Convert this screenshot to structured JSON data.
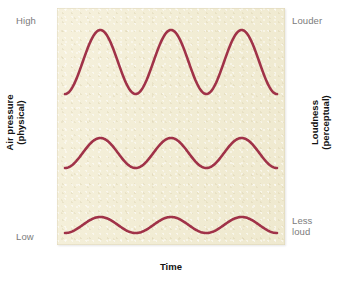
{
  "figure": {
    "axes": {
      "left_title": "Air pressure\n(physical)",
      "right_title": "Loudness\n(perceptual)",
      "bottom_title": "Time",
      "left_top_label": "High",
      "left_bottom_label": "Low",
      "right_top_label": "Louder",
      "right_bottom_label": "Less\nloud"
    },
    "colors": {
      "wave": "#a03248",
      "panel_background": "#f3eed7",
      "scale_label": "#7b7b7b",
      "axis_title": "#131313"
    }
  },
  "chart_data": {
    "type": "line",
    "title": "",
    "xlabel": "Time",
    "ylabel": "Air pressure (physical)",
    "ylabel_right": "Loudness (perceptual)",
    "xlim": [
      0,
      3
    ],
    "ylim": [
      0,
      1
    ],
    "grid": false,
    "legend": "none",
    "x_tick_labels": [],
    "y_tick_labels": [
      "Low",
      "High"
    ],
    "y_tick_labels_right": [
      "Less loud",
      "Louder"
    ],
    "annotations": [
      "Three sine waves of identical frequency (3 cycles) with decreasing amplitude from top to bottom, illustrating that greater air-pressure amplitude is perceived as greater loudness."
    ],
    "series": [
      {
        "name": "Loud wave (large amplitude)",
        "waveform": "sine",
        "cycles": 3,
        "amplitude": 32,
        "baseline_y": 54,
        "color": "#a03248",
        "line_width": 2.6,
        "loudness": "Louder",
        "pressure": "High"
      },
      {
        "name": "Medium wave (moderate amplitude)",
        "waveform": "sine",
        "cycles": 3,
        "amplitude": 15,
        "baseline_y": 145,
        "color": "#a03248",
        "line_width": 2.6,
        "loudness": "Moderate",
        "pressure": "Medium"
      },
      {
        "name": "Soft wave (small amplitude)",
        "waveform": "sine",
        "cycles": 3,
        "amplitude": 8,
        "baseline_y": 217,
        "color": "#a03248",
        "line_width": 2.6,
        "loudness": "Less loud",
        "pressure": "Low"
      }
    ]
  }
}
